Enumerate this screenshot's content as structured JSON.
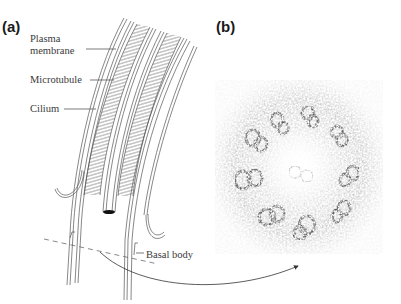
{
  "figure": {
    "panel_a": {
      "label": "(a)",
      "annotations": {
        "plasma_membrane_line1": "Plasma",
        "plasma_membrane_line2": "membrane",
        "microtubule": "Microtubule",
        "cilium": "Cilium",
        "basal_body": "Basal body"
      }
    },
    "panel_b": {
      "label": "(b)",
      "description": "Electron micrograph cross-section of cilium showing 9+2 microtubule arrangement"
    },
    "colors": {
      "line": "#555555",
      "text": "#3a3a3a",
      "label": "#1a1a1a",
      "em_dark": "#2a2a2a"
    }
  }
}
